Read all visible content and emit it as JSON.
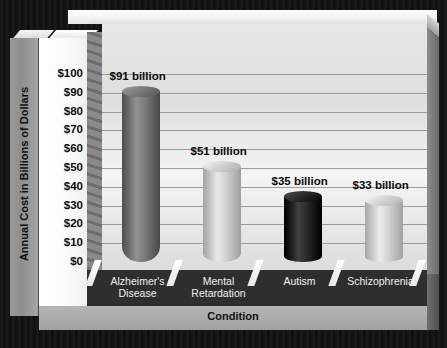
{
  "chart_data": {
    "type": "bar",
    "title": "",
    "xlabel": "Condition",
    "ylabel": "Annual Cost in Billions of Dollars",
    "categories": [
      "Alzheimer's\nDisease",
      "Mental\nRetardation",
      "Autism",
      "Schizophrenia"
    ],
    "values": [
      91,
      51,
      35,
      33
    ],
    "data_labels": [
      "$91 billion",
      "$51 billion",
      "$35 billion",
      "$33 billion"
    ],
    "ylim": [
      0,
      100
    ],
    "ytick_values": [
      0,
      10,
      20,
      30,
      40,
      50,
      60,
      70,
      80,
      90,
      100
    ],
    "ytick_labels": [
      "$0",
      "$10",
      "$20",
      "$30",
      "$40",
      "$50",
      "$60",
      "$70",
      "$80",
      "$90",
      "$100"
    ],
    "grid": true,
    "legend": false,
    "style": "3d-cylinder",
    "bar_colors": [
      "#6f6f6f",
      "#c6c6c6",
      "#1e1e1e",
      "#c9c9c9"
    ]
  },
  "axes": {
    "y_title": "Annual Cost in Billions of Dollars",
    "x_title": "Condition"
  },
  "colors": {
    "background": "#101010",
    "plot_background": "#e8e8e8",
    "floor": "#2e2e2e",
    "gridline": "#9b9b9b"
  }
}
